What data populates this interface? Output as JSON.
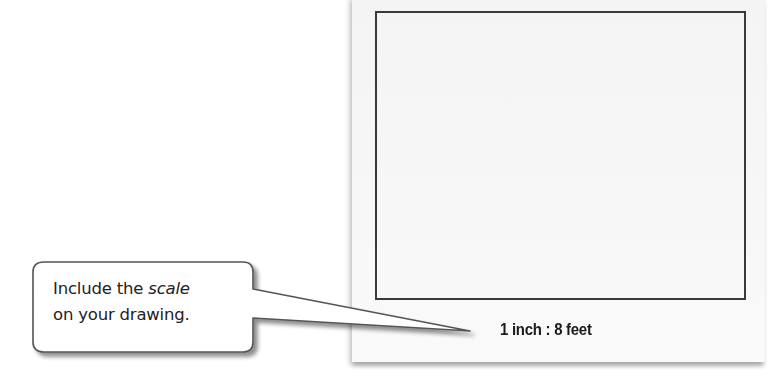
{
  "paper": {
    "frame_description": "blank drawing frame",
    "scale_label": "1 inch : 8 feet",
    "colors": {
      "paper": "#f6f6f6",
      "frame_border": "#3a3a3a",
      "text": "#1a1a1a"
    }
  },
  "callout": {
    "line1_prefix": "Include the ",
    "line1_emphasis": "scale",
    "line2": "on your drawing.",
    "colors": {
      "fill": "#ffffff",
      "border": "#555555",
      "shadow": "#9a9a9a"
    }
  }
}
